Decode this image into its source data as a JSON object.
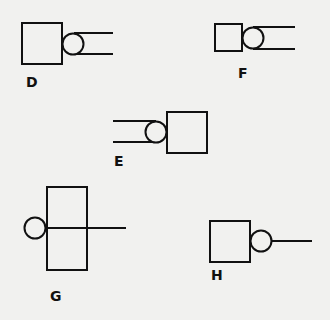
{
  "figures": [
    {
      "label": "D",
      "shape": "square-circle-double-line",
      "direction": "right"
    },
    {
      "label": "F",
      "shape": "square-circle-double-line",
      "direction": "right"
    },
    {
      "label": "E",
      "shape": "double-line-circle-square",
      "direction": "left"
    },
    {
      "label": "G",
      "shape": "tall-rectangle-circle-single-line",
      "direction": "through"
    },
    {
      "label": "H",
      "shape": "square-circle-single-line",
      "direction": "right"
    }
  ],
  "colors": {
    "stroke": "#111111",
    "background": "#f1f1ef"
  }
}
